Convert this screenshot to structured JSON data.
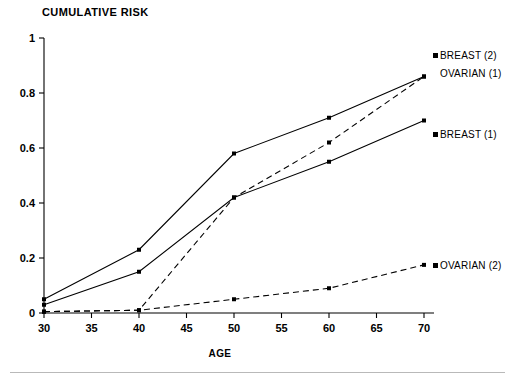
{
  "chart_data": {
    "type": "line",
    "title": "CUMULATIVE RISK",
    "xlabel": "AGE",
    "ylabel": "",
    "x": [
      30,
      40,
      50,
      60,
      70
    ],
    "xlim": [
      30,
      70
    ],
    "ylim": [
      0,
      1
    ],
    "xticks": [
      "30",
      "35",
      "40",
      "45",
      "50",
      "55",
      "60",
      "65",
      "70"
    ],
    "xtick_values": [
      30,
      35,
      40,
      45,
      50,
      55,
      60,
      65,
      70
    ],
    "yticks": [
      "0",
      "0.2",
      "0.4",
      "0.6",
      "0.8",
      "1"
    ],
    "ytick_values": [
      0,
      0.2,
      0.4,
      0.6,
      0.8,
      1
    ],
    "grid": false,
    "legend_position": "inline-right",
    "series": [
      {
        "name": "BREAST (2)",
        "style": "solid",
        "color": "#000000",
        "marker": "square",
        "values": [
          0.05,
          0.23,
          0.58,
          0.71,
          0.86
        ]
      },
      {
        "name": "OVARIAN (1)",
        "style": "dashed",
        "color": "#000000",
        "marker": "square",
        "values": [
          0.005,
          0.01,
          0.42,
          0.62,
          0.86
        ]
      },
      {
        "name": "BREAST (1)",
        "style": "solid",
        "color": "#000000",
        "marker": "square",
        "values": [
          0.03,
          0.15,
          0.42,
          0.55,
          0.7
        ]
      },
      {
        "name": "OVARIAN (2)",
        "style": "dashed",
        "color": "#000000",
        "marker": "square",
        "values": [
          0.005,
          0.01,
          0.05,
          0.09,
          0.175
        ]
      }
    ]
  },
  "labels": {
    "title": "CUMULATIVE RISK",
    "xlabel": "AGE",
    "series_breast2": "BREAST (2)",
    "series_ovarian1": "OVARIAN (1)",
    "series_breast1": "BREAST (1)",
    "series_ovarian2": "OVARIAN (2)",
    "y0": "0",
    "y02": "0.2",
    "y04": "0.4",
    "y06": "0.6",
    "y08": "0.8",
    "y1": "1",
    "x30": "30",
    "x35": "35",
    "x40": "40",
    "x45": "45",
    "x50": "50",
    "x55": "55",
    "x60": "60",
    "x65": "65",
    "x70": "70"
  }
}
